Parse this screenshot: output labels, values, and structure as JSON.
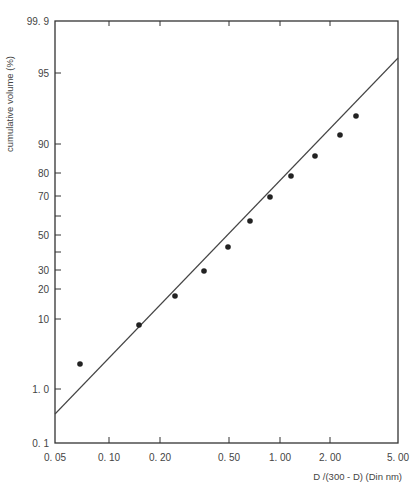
{
  "chart_data": {
    "type": "scatter",
    "title": "",
    "xlabel": "D /(300 - D) (Din nm)",
    "ylabel": "cumulative volume (%)",
    "x_scale": "log",
    "y_scale": "probability",
    "xlim": [
      0.05,
      5.0
    ],
    "ylim": [
      0.1,
      99.9
    ],
    "grid": false,
    "legend": null,
    "x_ticks": [
      {
        "value": 0.05,
        "label": "0. 05",
        "px": 55
      },
      {
        "value": 0.1,
        "label": "0. 10",
        "px": 109
      },
      {
        "value": 0.2,
        "label": "0. 20",
        "px": 160
      },
      {
        "value": 0.5,
        "label": "0. 50",
        "px": 229
      },
      {
        "value": 1.0,
        "label": "1. 00",
        "px": 280
      },
      {
        "value": 2.0,
        "label": "2. 00",
        "px": 330
      },
      {
        "value": 5.0,
        "label": "5. 00",
        "px": 398
      }
    ],
    "y_ticks": [
      {
        "value": 99.9,
        "label": "99. 9",
        "px": 21
      },
      {
        "value": 95,
        "label": "95",
        "px": 73
      },
      {
        "value": 90,
        "label": "90",
        "px": 144
      },
      {
        "value": 80,
        "label": "80",
        "px": 173
      },
      {
        "value": 70,
        "label": "70",
        "px": 196
      },
      {
        "value": 60,
        "label": "",
        "px": 216
      },
      {
        "value": 50,
        "label": "50",
        "px": 235
      },
      {
        "value": 40,
        "label": "",
        "px": 252
      },
      {
        "value": 30,
        "label": "30",
        "px": 270
      },
      {
        "value": 20,
        "label": "20",
        "px": 289
      },
      {
        "value": 10,
        "label": "10",
        "px": 319
      },
      {
        "value": 1.0,
        "label": "1. 0",
        "px": 389
      },
      {
        "value": 0.1,
        "label": "0. 1",
        "px": 443
      }
    ],
    "series": [
      {
        "name": "measured",
        "marker": "filled-circle",
        "x": [
          0.075,
          0.16,
          0.26,
          0.38,
          0.51,
          0.7,
          0.92,
          1.21,
          1.65,
          2.25,
          2.8
        ],
        "y": [
          2.5,
          8,
          17,
          27,
          42,
          56,
          69,
          79,
          86,
          92,
          96
        ],
        "px": [
          [
            80,
            364
          ],
          [
            139,
            325
          ],
          [
            175,
            296
          ],
          [
            204,
            271
          ],
          [
            228,
            247
          ],
          [
            250,
            221
          ],
          [
            270,
            197
          ],
          [
            291,
            176
          ],
          [
            315,
            156
          ],
          [
            340,
            135
          ],
          [
            356,
            116
          ]
        ]
      },
      {
        "name": "fit line",
        "type": "line",
        "x": [
          0.05,
          5.0
        ],
        "y": [
          0.4,
          97
        ],
        "px": [
          [
            55,
            414
          ],
          [
            398,
            58
          ]
        ]
      }
    ]
  }
}
